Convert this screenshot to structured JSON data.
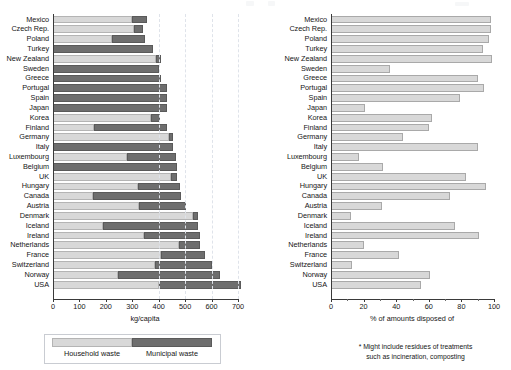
{
  "countries": [
    "Mexico",
    "Czech Rep.",
    "Poland",
    "Turkey",
    "New Zealand",
    "Sweden",
    "Greece",
    "Portugal",
    "Spain",
    "Japan",
    "Korea",
    "Finland",
    "Germany",
    "Italy",
    "Luxembourg",
    "Belgium",
    "UK",
    "Hungary",
    "Canada",
    "Austria",
    "Denmark",
    "Iceland",
    "Ireland",
    "Netherlands",
    "France",
    "Switzerland",
    "Norway",
    "USA"
  ],
  "chart_data": [
    {
      "type": "bar",
      "id": "waste-generation",
      "orientation": "horizontal",
      "stacked": true,
      "title": "",
      "xlabel": "kg/capita",
      "ylabel": "",
      "xlim": [
        0,
        700
      ],
      "xticks": [
        0,
        100,
        200,
        300,
        400,
        500,
        600,
        700
      ],
      "xticklabels": [
        "0",
        "100",
        "200",
        "300",
        "400",
        "500",
        "600",
        "700"
      ],
      "grid": "vertical-dashed",
      "legend_position": "below",
      "categories": [
        "Mexico",
        "Czech Rep.",
        "Poland",
        "Turkey",
        "New Zealand",
        "Sweden",
        "Greece",
        "Portugal",
        "Spain",
        "Japan",
        "Korea",
        "Finland",
        "Germany",
        "Italy",
        "Luxembourg",
        "Belgium",
        "UK",
        "Hungary",
        "Canada",
        "Austria",
        "Denmark",
        "Iceland",
        "Ireland",
        "Netherlands",
        "France",
        "Switzerland",
        "Norway",
        "USA"
      ],
      "series": [
        {
          "name": "Household waste",
          "color": "#d8d8d8",
          "values": [
            300,
            305,
            225,
            0,
            390,
            0,
            0,
            0,
            0,
            0,
            370,
            155,
            440,
            0,
            280,
            0,
            445,
            320,
            150,
            325,
            530,
            190,
            345,
            475,
            410,
            385,
            245,
            400
          ]
        },
        {
          "name": "Municipal waste",
          "color": "#6e6e6e",
          "values": [
            55,
            35,
            125,
            380,
            20,
            400,
            410,
            430,
            430,
            430,
            35,
            275,
            15,
            455,
            185,
            470,
            25,
            160,
            335,
            180,
            20,
            360,
            210,
            80,
            165,
            215,
            385,
            310
          ]
        }
      ],
      "totals": [
        355,
        340,
        350,
        380,
        410,
        400,
        410,
        430,
        430,
        430,
        405,
        430,
        455,
        455,
        465,
        470,
        470,
        480,
        485,
        505,
        550,
        550,
        555,
        555,
        575,
        600,
        630,
        710
      ]
    },
    {
      "type": "bar",
      "id": "landfill-share",
      "orientation": "horizontal",
      "stacked": false,
      "title": "",
      "xlabel": "% of amounts disposed of",
      "ylabel": "",
      "xlim": [
        0,
        100
      ],
      "xticks": [
        0,
        20,
        40,
        60,
        80,
        100
      ],
      "xticklabels": [
        "0",
        "20",
        "40",
        "60",
        "80",
        "100"
      ],
      "grid": "none",
      "legend_position": "none",
      "categories": [
        "Mexico",
        "Czech Rep.",
        "Poland",
        "Turkey",
        "New Zealand",
        "Sweden",
        "Greece",
        "Portugal",
        "Spain",
        "Japan",
        "Korea",
        "Finland",
        "Germany",
        "Italy",
        "Luxembourg",
        "Belgium",
        "UK",
        "Hungary",
        "Canada",
        "Austria",
        "Denmark",
        "Iceland",
        "Ireland",
        "Netherlands",
        "France",
        "Switzerland",
        "Norway",
        "USA"
      ],
      "series": [
        {
          "name": "% of amounts disposed of",
          "color": "#dcdcdc",
          "values": [
            98,
            98,
            97,
            93,
            99,
            36,
            90,
            94,
            79,
            21,
            62,
            60,
            44,
            90,
            17,
            32,
            83,
            95,
            73,
            31,
            12,
            76,
            91,
            20,
            42,
            13,
            61,
            55
          ]
        }
      ],
      "footnote": {
        "line1": "* Might include residues of treatments",
        "line2": "such as incineration, composting"
      }
    }
  ],
  "left_chart": {
    "axis_title": "kg/capita",
    "ticklabels": [
      "0",
      "100",
      "200",
      "300",
      "400",
      "500",
      "600",
      "700"
    ],
    "legend": {
      "household_label": "Household waste",
      "municipal_label": "Municipal waste"
    }
  },
  "right_chart": {
    "axis_title": "% of amounts disposed of",
    "ticklabels": [
      "0",
      "20",
      "40",
      "60",
      "80",
      "100"
    ],
    "footnote_line1": "* Might include residues of treatments",
    "footnote_line2": "such as incineration, composting"
  }
}
